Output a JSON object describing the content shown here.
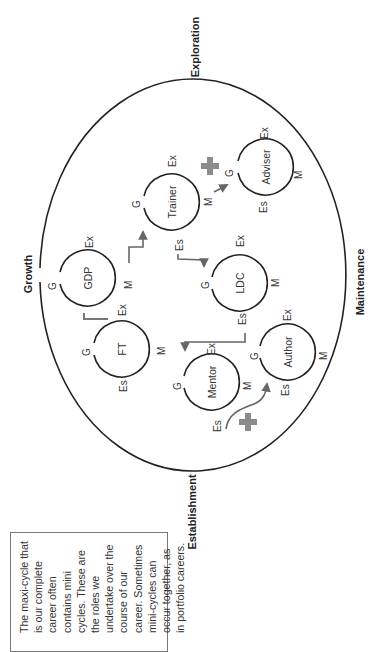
{
  "diagram": {
    "orientation": "rotated-90-ccw",
    "maxi_cycle": {
      "phases": [
        {
          "id": "exploration",
          "label": "Exploration"
        },
        {
          "id": "maintenance",
          "label": "Maintenance"
        },
        {
          "id": "establishment",
          "label": "Establishment"
        },
        {
          "id": "growth",
          "label": "Growth"
        }
      ]
    },
    "stage_abbrev": {
      "growth": "G",
      "exploration": "Ex",
      "maintenance": "M",
      "establishment": "Es"
    },
    "mini_cycles": [
      {
        "id": "gdp",
        "label": "GDP"
      },
      {
        "id": "ft",
        "label": "FT"
      },
      {
        "id": "trainer",
        "label": "Trainer"
      },
      {
        "id": "ldc",
        "label": "LDC"
      },
      {
        "id": "mentor",
        "label": "Mentor"
      },
      {
        "id": "adviser",
        "label": "Adviser"
      },
      {
        "id": "author",
        "label": "Author"
      }
    ],
    "connections": [
      {
        "from": "ft",
        "to": "gdp"
      },
      {
        "from": "gdp",
        "to": "trainer"
      },
      {
        "from": "trainer",
        "to": "adviser",
        "concurrent": true
      },
      {
        "from": "trainer",
        "to": "ldc"
      },
      {
        "from": "ldc",
        "to": "mentor"
      },
      {
        "from": "mentor",
        "to": "author",
        "concurrent": true
      }
    ],
    "concurrent_marker": "+",
    "colors": {
      "stroke": "#222222",
      "arrow": "#666666",
      "plus": "#8c8c8c",
      "frame": "#777777"
    }
  },
  "caption": {
    "text": "The maxi-cycle that\nis our complete\ncareer often\ncontains mini\ncycles. These are\nthe roles we\nundertake over the\ncourse of our\ncareer. Sometimes\nmini-cycles can\noccur together, as\nin portfolio careers."
  }
}
